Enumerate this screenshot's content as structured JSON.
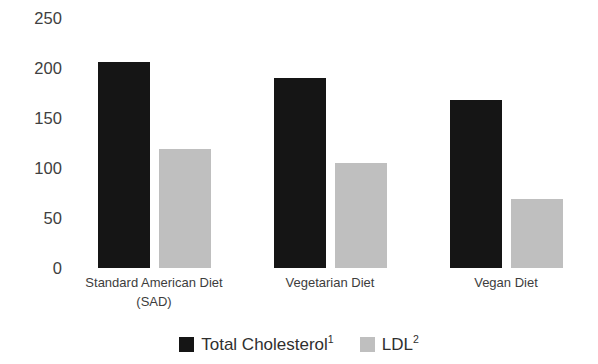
{
  "chart_data": {
    "type": "bar",
    "title": "",
    "subtitle": "",
    "xlabel": "",
    "ylabel": "",
    "ylim": [
      0,
      250
    ],
    "ytick_values": [
      0,
      50,
      100,
      150,
      200,
      250
    ],
    "ytick_labels": [
      "0",
      "50",
      "100",
      "150",
      "200",
      "250"
    ],
    "grid": false,
    "legend_position": "bottom",
    "categories": [
      "Standard American Diet\n(SAD)",
      "Vegetarian Diet",
      "Vegan Diet"
    ],
    "series": [
      {
        "name": "Total Cholesterol",
        "footnote": "1",
        "color": "#151515",
        "values": [
          206,
          190,
          168
        ]
      },
      {
        "name": "LDL",
        "footnote": "2",
        "color": "#bfbfbf",
        "values": [
          119,
          105,
          69
        ]
      }
    ]
  },
  "legend": {
    "entries": [
      {
        "label": "Total Cholesterol",
        "sup": "1",
        "swatch": "total-cholesterol-swatch"
      },
      {
        "label": "LDL",
        "sup": "2",
        "swatch": "ldl-swatch"
      }
    ]
  },
  "axis": {
    "y_labels": [
      "250",
      "200",
      "150",
      "100",
      "50",
      "0"
    ]
  },
  "colors": {
    "total_cholesterol": "#151515",
    "ldl": "#bfbfbf",
    "text": "#3b3b3b",
    "background": "#ffffff"
  }
}
